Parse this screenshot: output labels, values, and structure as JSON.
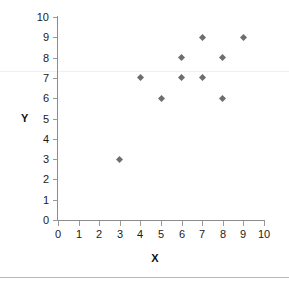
{
  "chart_data": {
    "type": "scatter",
    "title": "",
    "xlabel": "X",
    "ylabel": "Y",
    "xlim": [
      0,
      10
    ],
    "ylim": [
      0,
      10
    ],
    "xticks": [
      0,
      1,
      2,
      3,
      4,
      5,
      6,
      7,
      8,
      9,
      10
    ],
    "yticks": [
      0,
      1,
      2,
      3,
      4,
      5,
      6,
      7,
      8,
      9,
      10
    ],
    "xtick_labels": [
      "0",
      "1",
      "2",
      "3",
      "4",
      "5",
      "6",
      "7",
      "8",
      "9",
      "10"
    ],
    "ytick_labels": [
      "0",
      "1",
      "2",
      "3",
      "4",
      "5",
      "6",
      "7",
      "8",
      "9",
      "10"
    ],
    "grid": false,
    "legend": null,
    "marker": "diamond",
    "marker_color": "#6e6e6e",
    "series": [
      {
        "name": "",
        "points": [
          {
            "x": 3,
            "y": 3
          },
          {
            "x": 4,
            "y": 7
          },
          {
            "x": 5,
            "y": 6
          },
          {
            "x": 6,
            "y": 7
          },
          {
            "x": 6,
            "y": 8
          },
          {
            "x": 7,
            "y": 7
          },
          {
            "x": 7,
            "y": 9
          },
          {
            "x": 8,
            "y": 6
          },
          {
            "x": 8,
            "y": 8
          },
          {
            "x": 9,
            "y": 9
          }
        ]
      }
    ]
  },
  "axes": {
    "y_title": "Y",
    "x_title": "X"
  },
  "colors": {
    "axis": "#8c8c8c",
    "tick": "#9a9a9a",
    "text": "#1a1a1a",
    "marker": "#6e6e6e",
    "background": "#ffffff"
  }
}
